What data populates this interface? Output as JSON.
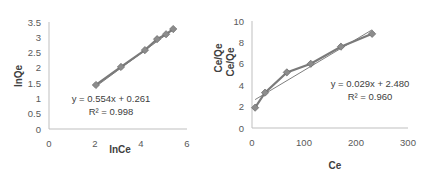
{
  "chart_data": [
    {
      "type": "scatter",
      "title": "",
      "xlabel": "lnCe",
      "ylabel": "lnQe",
      "xlim": [
        0,
        6
      ],
      "ylim": [
        0,
        3.5
      ],
      "x_ticks": [
        "0",
        "2",
        "4",
        "6"
      ],
      "y_ticks": [
        "0",
        "0.5",
        "1",
        "1.5",
        "2",
        "2.5",
        "3",
        "3.5"
      ],
      "grid": false,
      "legend": "none",
      "series": [
        {
          "name": "data",
          "marker": "diamond",
          "line": true,
          "x": [
            2.04,
            3.13,
            4.17,
            4.7,
            5.09,
            5.4
          ],
          "y": [
            1.44,
            2.03,
            2.58,
            2.94,
            3.1,
            3.27
          ]
        }
      ],
      "trendline": {
        "equation": "y = 0.554x + 0.261",
        "r2_label": "R² = 0.998",
        "slope": 0.554,
        "intercept": 0.261,
        "r2": 0.998
      }
    },
    {
      "type": "scatter",
      "title": "",
      "xlabel": "Ce",
      "ylabel": "Ce/Qe",
      "ylabel_duplicate": "Ce/Qe",
      "xlim": [
        0,
        300
      ],
      "ylim": [
        0,
        10
      ],
      "x_ticks": [
        "0",
        "100",
        "200",
        "300"
      ],
      "y_ticks": [
        "0",
        "2",
        "4",
        "6",
        "8",
        "10"
      ],
      "grid": false,
      "legend": "none",
      "series": [
        {
          "name": "data",
          "marker": "diamond",
          "line": true,
          "x": [
            6,
            25,
            67,
            113,
            171,
            231
          ],
          "y": [
            1.9,
            3.3,
            5.2,
            6.0,
            7.6,
            8.8
          ]
        }
      ],
      "trendline": {
        "equation": "y = 0.029x + 2.480",
        "r2_label": "R² = 0.960",
        "slope": 0.029,
        "intercept": 2.48,
        "r2": 0.96
      }
    }
  ]
}
